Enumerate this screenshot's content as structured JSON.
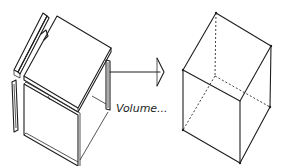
{
  "diagram": {
    "left_figure": {
      "name": "exploded-planes",
      "description": "separate planes of a box shown apart"
    },
    "arrow": {
      "direction": "right"
    },
    "label": "Volume...",
    "right_figure": {
      "name": "volume-box",
      "description": "wireframe box with hidden edges dashed"
    },
    "colors": {
      "ink": "#1e1e1e",
      "background": "#ffffff"
    }
  }
}
